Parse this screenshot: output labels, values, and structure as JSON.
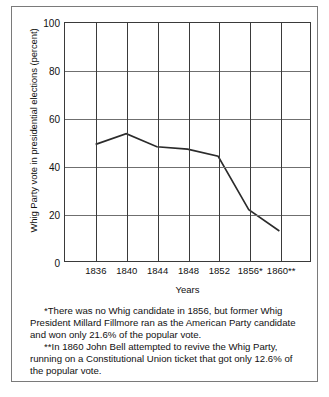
{
  "chart_data": {
    "type": "line",
    "title": "",
    "xlabel": "Years",
    "ylabel": "Whig Party vote in presidential elections (percent)",
    "categories": [
      "1836",
      "1840",
      "1844",
      "1848",
      "1852",
      "1856*",
      "1860**"
    ],
    "x": [
      1836,
      1840,
      1844,
      1848,
      1852,
      1856,
      1860
    ],
    "values": [
      49,
      53.5,
      48,
      47,
      44,
      21.6,
      12.6
    ],
    "series": [
      {
        "name": "Whig Party vote",
        "values": [
          49,
          53.5,
          48,
          47,
          44,
          21.6,
          12.6
        ]
      }
    ],
    "ylim": [
      0,
      100
    ],
    "yticks": [
      0,
      20,
      40,
      60,
      80,
      100
    ],
    "ytick_labels": [
      "0",
      "20",
      "40",
      "60",
      "80",
      "100"
    ],
    "grid": "both",
    "legend": "none",
    "line_color": "#2b2b2b",
    "grid_color": "#6f6f6f",
    "axis_color": "#3a3a3a"
  },
  "footnotes": [
    "*There was no Whig candidate in 1856, but former Whig President Millard Fillmore ran as the American Party candidate and won only 21.6% of the popular vote.",
    "**In 1860 John Bell attempted to revive the Whig Party, running on a Constitutional Union ticket that got only 12.6% of the popular vote."
  ]
}
